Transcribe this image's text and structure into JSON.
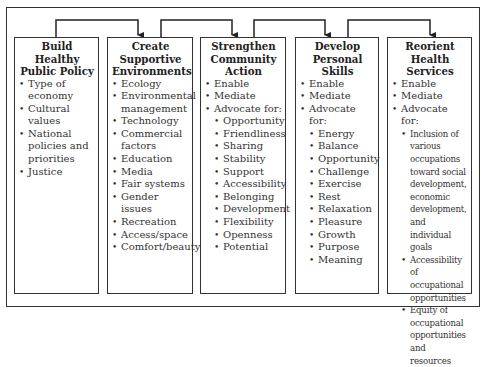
{
  "diagram": {
    "boxes": [
      {
        "title": "Build Healthy Public Policy",
        "items": [
          "Type of economy",
          "Cultural values",
          "National policies and priorities",
          "Justice"
        ]
      },
      {
        "title": "Create Supportive Environments",
        "items": [
          "Ecology",
          "Environmental management",
          "Technology",
          "Commercial factors",
          "Education",
          "Media",
          "Fair systems",
          "Gender issues",
          "Recreation",
          "Access/space",
          "Comfort/beauty"
        ]
      },
      {
        "title": "Strengthen Community Action",
        "items": [
          "Enable",
          "Mediate",
          "Advocate for:"
        ],
        "advocate_for": [
          "Opportunity",
          "Friendliness",
          "Sharing",
          "Stability",
          "Support",
          "Accessibility",
          "Belonging",
          "Development",
          "Flexibility",
          "Openness",
          "Potential"
        ]
      },
      {
        "title": "Develop Personal Skills",
        "items": [
          "Enable",
          "Mediate",
          "Advocate for:"
        ],
        "advocate_for": [
          "Energy",
          "Balance",
          "Opportunity",
          "Challenge",
          "Exercise",
          "Rest",
          "Relaxation",
          "Pleasure",
          "Growth",
          "Purpose",
          "Meaning"
        ]
      },
      {
        "title": "Reorient Health Services",
        "items": [
          "Enable",
          "Mediate",
          "Advocate for:"
        ],
        "advocate_for": [
          "Inclusion of various occupations toward social development, economic development, and individual goals",
          "Accessibility of occupational opportunities",
          "Equity of occupational opportunities and resources"
        ]
      }
    ],
    "connectors": [
      {
        "from": "Build Healthy Public Policy",
        "to": "Create Supportive Environments"
      },
      {
        "from": "Create Supportive Environments",
        "to": "Strengthen Community Action"
      },
      {
        "from": "Strengthen Community Action",
        "to": "Develop Personal Skills"
      },
      {
        "from": "Develop Personal Skills",
        "to": "Reorient Health Services"
      }
    ]
  }
}
